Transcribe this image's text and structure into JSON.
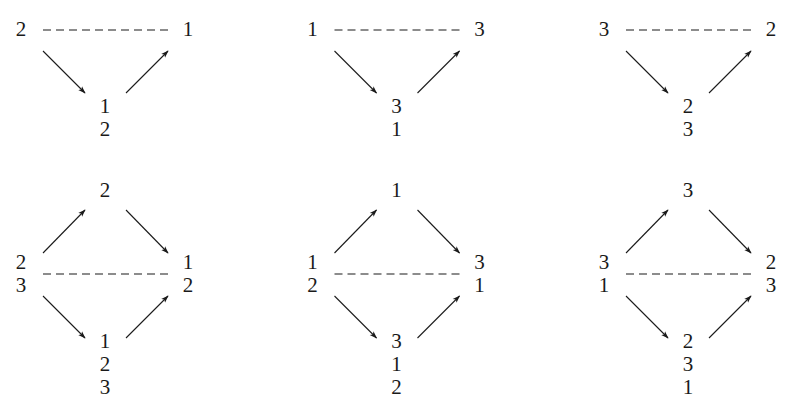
{
  "figure": {
    "colors": {
      "ink": "#1a1a1a",
      "background": "#ffffff"
    },
    "top_row": [
      {
        "id": "t1",
        "left": [
          "2"
        ],
        "right": [
          "1"
        ],
        "bottom": [
          "1",
          "2"
        ]
      },
      {
        "id": "t2",
        "left": [
          "1"
        ],
        "right": [
          "3"
        ],
        "bottom": [
          "3",
          "1"
        ]
      },
      {
        "id": "t3",
        "left": [
          "3"
        ],
        "right": [
          "2"
        ],
        "bottom": [
          "2",
          "3"
        ]
      }
    ],
    "bottom_row": [
      {
        "id": "b1",
        "top": [
          "2"
        ],
        "left": [
          "2",
          "3"
        ],
        "right": [
          "1",
          "2"
        ],
        "bottom": [
          "1",
          "2",
          "3"
        ]
      },
      {
        "id": "b2",
        "top": [
          "1"
        ],
        "left": [
          "1",
          "2"
        ],
        "right": [
          "3",
          "1"
        ],
        "bottom": [
          "3",
          "1",
          "2"
        ]
      },
      {
        "id": "b3",
        "top": [
          "3"
        ],
        "left": [
          "3",
          "1"
        ],
        "right": [
          "2",
          "3"
        ],
        "bottom": [
          "2",
          "3",
          "1"
        ]
      }
    ],
    "edges": {
      "triangle": [
        "left -> bottom (arrow)",
        "bottom -> right (arrow)",
        "left -- right (dashed)"
      ],
      "diamond": [
        "left -> top (arrow)",
        "top -> right (arrow)",
        "left -> bottom (arrow)",
        "bottom -> right (arrow)",
        "left -- right (dashed)"
      ]
    }
  }
}
